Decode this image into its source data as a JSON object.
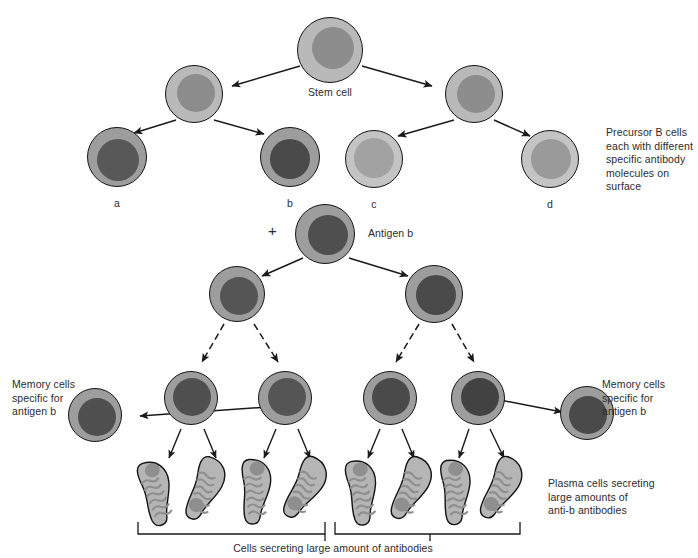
{
  "diagram": {
    "title_labels": {
      "stem_cell": "Stem cell",
      "precursor": "Precursor B cells\neach with different\nspecific antibody\nmolecules on surface",
      "antigen": "Antigen b",
      "plus": "+",
      "memory_left": "Memory cells\nspecific for\nantigen b",
      "memory_right": "Memory cells\nspecific for\nantigen b",
      "plasma": "Plasma cells secreting\nlarge amounts of\nanti-b antibodies",
      "bracket_caption": "Cells secreting large amount of antibodies"
    },
    "precursor_labels": [
      "a",
      "b",
      "c",
      "d"
    ],
    "colors": {
      "outline": "#141414",
      "cyto_light": "#b9b9b9",
      "cyto_mid": "#9d9d9d",
      "cyto_pale": "#c4c4c4",
      "nuc_mid": "#8d8d8d",
      "nuc_dark": "#585858",
      "nuc_darker": "#4a4a4a",
      "plasma_body": "#b5b5b5",
      "plasma_er": "#8f8f8f",
      "text": "#2b2b2b"
    },
    "cells": {
      "stem": {
        "cx": 330,
        "cy": 50,
        "r": 33,
        "cyto": "#b9b9b9",
        "nuc": "#8d8d8d",
        "nr": 21,
        "nox": 2,
        "noy": -3
      },
      "row2": [
        {
          "cx": 194,
          "cy": 94,
          "r": 29,
          "cyto": "#b9b9b9",
          "nuc": "#8d8d8d",
          "nr": 19,
          "nox": 1,
          "noy": -2
        },
        {
          "cx": 474,
          "cy": 94,
          "r": 29,
          "cyto": "#b9b9b9",
          "nuc": "#8d8d8d",
          "nr": 19,
          "nox": 1,
          "noy": -1
        }
      ],
      "precursors": [
        {
          "label": "a",
          "cx": 117,
          "cy": 157,
          "r": 30,
          "cyto": "#9d9d9d",
          "nuc": "#585858",
          "nr": 21,
          "nox": 0,
          "noy": 2
        },
        {
          "label": "b",
          "cx": 290,
          "cy": 157,
          "r": 30,
          "cyto": "#9d9d9d",
          "nuc": "#4a4a4a",
          "nr": 20,
          "nox": -1,
          "noy": 1
        },
        {
          "label": "c",
          "cx": 374,
          "cy": 159,
          "r": 29,
          "cyto": "#c4c4c4",
          "nuc": "#a2a2a2",
          "nr": 20,
          "nox": -1,
          "noy": -2
        },
        {
          "label": "d",
          "cx": 550,
          "cy": 159,
          "r": 29,
          "cyto": "#c4c4c4",
          "nuc": "#9a9a9a",
          "nr": 20,
          "nox": 0,
          "noy": -1
        }
      ],
      "antigen": {
        "cx": 325,
        "cy": 234,
        "r": 30,
        "cyto": "#9d9d9d",
        "nuc": "#4f4f4f",
        "nr": 20,
        "nox": 2,
        "noy": 0
      },
      "row3": [
        {
          "cx": 237,
          "cy": 294,
          "r": 28,
          "cyto": "#9d9d9d",
          "nuc": "#555555",
          "nr": 19,
          "nox": 1,
          "noy": 1
        },
        {
          "cx": 434,
          "cy": 294,
          "r": 29,
          "cyto": "#9d9d9d",
          "nuc": "#4a4a4a",
          "nr": 20,
          "nox": 1,
          "noy": 0
        }
      ],
      "row4": [
        {
          "cx": 191,
          "cy": 398,
          "r": 27,
          "cyto": "#9d9d9d",
          "nuc": "#4f4f4f",
          "nr": 19,
          "nox": 0,
          "noy": -2
        },
        {
          "cx": 285,
          "cy": 398,
          "r": 27,
          "cyto": "#9d9d9d",
          "nuc": "#555555",
          "nr": 19,
          "nox": 1,
          "noy": -2
        },
        {
          "cx": 390,
          "cy": 398,
          "r": 27,
          "cyto": "#9d9d9d",
          "nuc": "#4a4a4a",
          "nr": 19,
          "nox": 0,
          "noy": -2
        },
        {
          "cx": 478,
          "cy": 398,
          "r": 27,
          "cyto": "#9d9d9d",
          "nuc": "#424242",
          "nr": 19,
          "nox": 1,
          "noy": -2
        }
      ],
      "memory": [
        {
          "side": "left",
          "cx": 95,
          "cy": 415,
          "r": 27,
          "cyto": "#9d9d9d",
          "nuc": "#4f4f4f",
          "nr": 19,
          "nox": 1,
          "noy": 1
        },
        {
          "side": "right",
          "cx": 587,
          "cy": 413,
          "r": 27,
          "cyto": "#9d9d9d",
          "nuc": "#4a4a4a",
          "nr": 19,
          "nox": 0,
          "noy": 1
        }
      ],
      "plasma_cells": [
        {
          "cx": 162,
          "cy": 489,
          "rot": -22
        },
        {
          "cx": 212,
          "cy": 489,
          "rot": 12
        },
        {
          "cx": 262,
          "cy": 489,
          "rot": -8
        },
        {
          "cx": 312,
          "cy": 489,
          "rot": 18
        },
        {
          "cx": 368,
          "cy": 489,
          "rot": -16
        },
        {
          "cx": 418,
          "cy": 489,
          "rot": 14
        },
        {
          "cx": 462,
          "cy": 489,
          "rot": -12
        },
        {
          "cx": 508,
          "cy": 489,
          "rot": 16
        }
      ]
    }
  }
}
